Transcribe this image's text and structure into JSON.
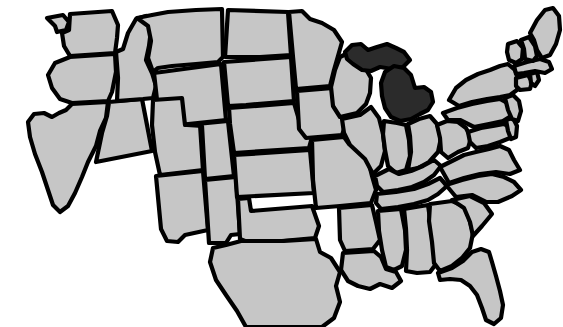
{
  "figure": {
    "kind": "choropleth-outline-map",
    "region": "United States (contiguous 48 states)",
    "title_fragment": "",
    "background_color": "#ffffff",
    "base_state_color": "#c6c6c6",
    "highlight_state_color": "#2b2b2b",
    "border_color": "#000000",
    "border_width_px": 4.2,
    "highlighted_states": [
      "Michigan"
    ]
  },
  "states": [
    {
      "code": "WA",
      "name": "Washington",
      "highlighted": false
    },
    {
      "code": "OR",
      "name": "Oregon",
      "highlighted": false
    },
    {
      "code": "CA",
      "name": "California",
      "highlighted": false
    },
    {
      "code": "NV",
      "name": "Nevada",
      "highlighted": false
    },
    {
      "code": "ID",
      "name": "Idaho",
      "highlighted": false
    },
    {
      "code": "MT",
      "name": "Montana",
      "highlighted": false
    },
    {
      "code": "WY",
      "name": "Wyoming",
      "highlighted": false
    },
    {
      "code": "UT",
      "name": "Utah",
      "highlighted": false
    },
    {
      "code": "AZ",
      "name": "Arizona",
      "highlighted": false
    },
    {
      "code": "CO",
      "name": "Colorado",
      "highlighted": false
    },
    {
      "code": "NM",
      "name": "New Mexico",
      "highlighted": false
    },
    {
      "code": "ND",
      "name": "North Dakota",
      "highlighted": false
    },
    {
      "code": "SD",
      "name": "South Dakota",
      "highlighted": false
    },
    {
      "code": "NE",
      "name": "Nebraska",
      "highlighted": false
    },
    {
      "code": "KS",
      "name": "Kansas",
      "highlighted": false
    },
    {
      "code": "OK",
      "name": "Oklahoma",
      "highlighted": false
    },
    {
      "code": "TX",
      "name": "Texas",
      "highlighted": false
    },
    {
      "code": "MN",
      "name": "Minnesota",
      "highlighted": false
    },
    {
      "code": "IA",
      "name": "Iowa",
      "highlighted": false
    },
    {
      "code": "MO",
      "name": "Missouri",
      "highlighted": false
    },
    {
      "code": "AR",
      "name": "Arkansas",
      "highlighted": false
    },
    {
      "code": "LA",
      "name": "Louisiana",
      "highlighted": false
    },
    {
      "code": "WI",
      "name": "Wisconsin",
      "highlighted": false
    },
    {
      "code": "IL",
      "name": "Illinois",
      "highlighted": false
    },
    {
      "code": "MI",
      "name": "Michigan",
      "highlighted": true
    },
    {
      "code": "IN",
      "name": "Indiana",
      "highlighted": false
    },
    {
      "code": "OH",
      "name": "Ohio",
      "highlighted": false
    },
    {
      "code": "KY",
      "name": "Kentucky",
      "highlighted": false
    },
    {
      "code": "TN",
      "name": "Tennessee",
      "highlighted": false
    },
    {
      "code": "MS",
      "name": "Mississippi",
      "highlighted": false
    },
    {
      "code": "AL",
      "name": "Alabama",
      "highlighted": false
    },
    {
      "code": "GA",
      "name": "Georgia",
      "highlighted": false
    },
    {
      "code": "FL",
      "name": "Florida",
      "highlighted": false
    },
    {
      "code": "SC",
      "name": "South Carolina",
      "highlighted": false
    },
    {
      "code": "NC",
      "name": "North Carolina",
      "highlighted": false
    },
    {
      "code": "VA",
      "name": "Virginia",
      "highlighted": false
    },
    {
      "code": "WV",
      "name": "West Virginia",
      "highlighted": false
    },
    {
      "code": "MD",
      "name": "Maryland",
      "highlighted": false
    },
    {
      "code": "DE",
      "name": "Delaware",
      "highlighted": false
    },
    {
      "code": "PA",
      "name": "Pennsylvania",
      "highlighted": false
    },
    {
      "code": "NJ",
      "name": "New Jersey",
      "highlighted": false
    },
    {
      "code": "NY",
      "name": "New York",
      "highlighted": false
    },
    {
      "code": "CT",
      "name": "Connecticut",
      "highlighted": false
    },
    {
      "code": "RI",
      "name": "Rhode Island",
      "highlighted": false
    },
    {
      "code": "MA",
      "name": "Massachusetts",
      "highlighted": false
    },
    {
      "code": "VT",
      "name": "Vermont",
      "highlighted": false
    },
    {
      "code": "NH",
      "name": "New Hampshire",
      "highlighted": false
    },
    {
      "code": "ME",
      "name": "Maine",
      "highlighted": false
    }
  ]
}
